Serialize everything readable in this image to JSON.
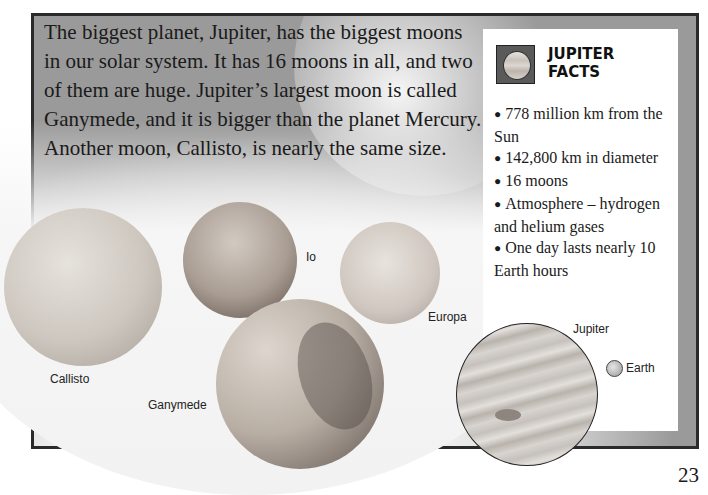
{
  "intro": {
    "text": "The biggest planet, Jupiter, has the biggest moons in our solar system. It has 16 moons in all, and two of them are huge. Jupiter’s largest moon is called Ganymede, and it is bigger than the planet Mercury. Another moon, Callisto, is nearly the same size."
  },
  "moons": {
    "callisto": "Callisto",
    "io": "Io",
    "europa": "Europa",
    "ganymede": "Ganymede"
  },
  "facts_box": {
    "title_line1": "JUPITER",
    "title_line2": "FACTS",
    "icon": "jupiter-planet-icon",
    "items": [
      "778 million km from the Sun",
      "142,800 km in diameter",
      "16 moons",
      "Atmosphere – hydrogen and helium gases",
      "One day lasts nearly 10 Earth hours"
    ]
  },
  "comparison": {
    "jupiter_label": "Jupiter",
    "earth_label": "Earth"
  },
  "page_number": "23"
}
